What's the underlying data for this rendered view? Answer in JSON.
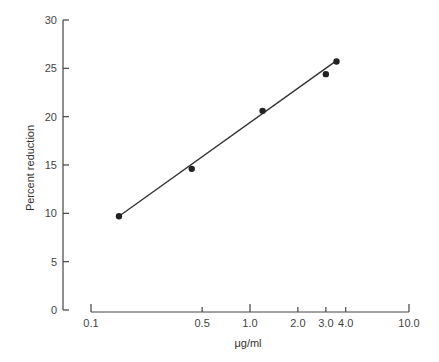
{
  "chart_data": {
    "type": "scatter",
    "title": "",
    "xlabel": "μg/ml",
    "ylabel": "Percent reduction",
    "xscale": "log",
    "xlim": [
      0.1,
      10.0
    ],
    "ylim": [
      0,
      30
    ],
    "x_ticks": [
      0.1,
      0.5,
      1.0,
      2.0,
      3.0,
      4.0,
      10.0
    ],
    "x_tick_labels": [
      "0.1",
      "0.5",
      "1.0",
      "2.0",
      "3.0",
      "4.0",
      "10.0"
    ],
    "y_ticks": [
      0,
      5,
      10,
      15,
      20,
      25,
      30
    ],
    "y_tick_labels": [
      "0",
      "5",
      "10",
      "15",
      "20",
      "25",
      "30"
    ],
    "grid": false,
    "legend": null,
    "series": [
      {
        "name": "Observed",
        "marker": "filled-circle",
        "points": [
          {
            "x": 0.15,
            "y": 9.7
          },
          {
            "x": 0.43,
            "y": 14.6
          },
          {
            "x": 1.2,
            "y": 20.6
          },
          {
            "x": 3.0,
            "y": 24.4
          },
          {
            "x": 3.5,
            "y": 25.7
          }
        ]
      },
      {
        "name": "Fit line",
        "type": "line",
        "points": [
          {
            "x": 0.15,
            "y": 9.7
          },
          {
            "x": 3.5,
            "y": 25.8
          }
        ]
      }
    ]
  },
  "colors": {
    "axis": "#444444",
    "point": "#222222",
    "line": "#333333",
    "background": "#ffffff"
  }
}
